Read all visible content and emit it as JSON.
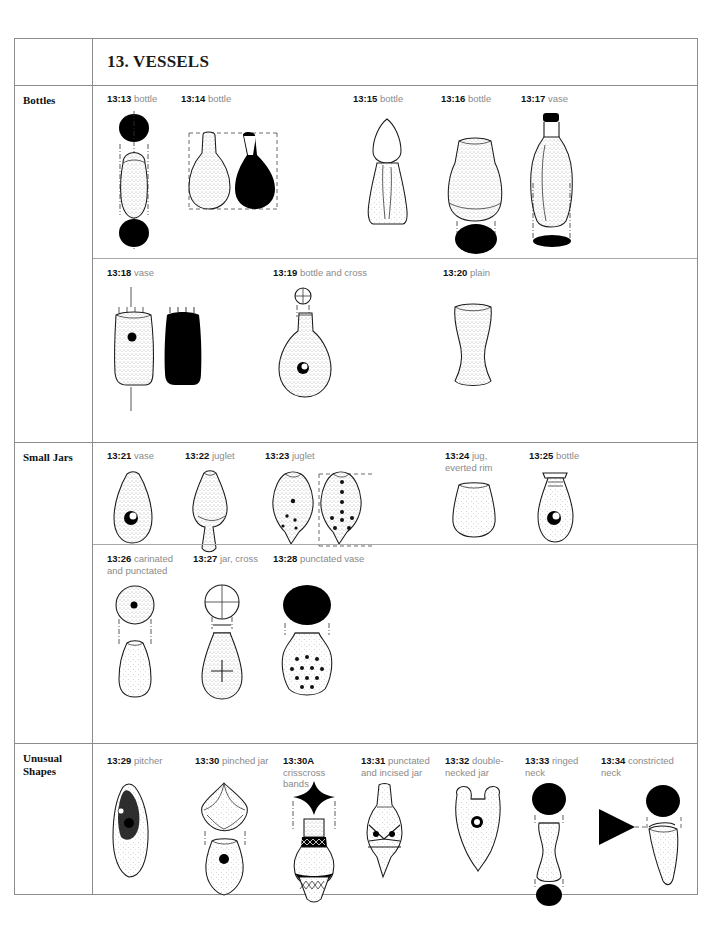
{
  "page": {
    "title": "13. VESSELS"
  },
  "sections": [
    {
      "id": "bottles",
      "category": "Bottles",
      "rows": [
        {
          "items": [
            {
              "num": "13:13",
              "desc": "bottle",
              "figure": "bottle-13-13"
            },
            {
              "num": "13:14",
              "desc": "bottle",
              "figure": "bottle-13-14"
            },
            {
              "num": "13:15",
              "desc": "bottle",
              "figure": "bottle-13-15"
            },
            {
              "num": "13:16",
              "desc": "bottle",
              "figure": "bottle-13-16"
            },
            {
              "num": "13:17",
              "desc": "vase",
              "figure": "vase-13-17"
            }
          ]
        },
        {
          "items": [
            {
              "num": "13:18",
              "desc": "vase",
              "figure": "vase-13-18"
            },
            {
              "num": "13:19",
              "desc": "bottle and cross",
              "figure": "bottle-cross-13-19"
            },
            {
              "num": "13:20",
              "desc": "plain",
              "figure": "plain-13-20"
            }
          ]
        }
      ]
    },
    {
      "id": "small-jars",
      "category": "Small Jars",
      "rows": [
        {
          "items": [
            {
              "num": "13:21",
              "desc": "vase",
              "figure": "vase-13-21"
            },
            {
              "num": "13:22",
              "desc": "juglet",
              "figure": "juglet-13-22"
            },
            {
              "num": "13:23",
              "desc": "juglet",
              "figure": "juglet-13-23"
            },
            {
              "num": "13:24",
              "desc": "jug, everted rim",
              "figure": "jug-13-24"
            },
            {
              "num": "13:25",
              "desc": "bottle",
              "figure": "bottle-13-25"
            }
          ]
        },
        {
          "items": [
            {
              "num": "13:26",
              "desc": "carinated and punctated",
              "figure": "carinated-13-26"
            },
            {
              "num": "13:27",
              "desc": "jar, cross",
              "figure": "jar-cross-13-27"
            },
            {
              "num": "13:28",
              "desc": "punctated vase",
              "figure": "punctated-vase-13-28"
            }
          ]
        }
      ]
    },
    {
      "id": "unusual-shapes",
      "category": "Unusual Shapes",
      "rows": [
        {
          "items": [
            {
              "num": "13:29",
              "desc": "pitcher",
              "figure": "pitcher-13-29"
            },
            {
              "num": "13:30",
              "desc": "pinched jar",
              "figure": "pinched-jar-13-30"
            },
            {
              "num": "13:30A",
              "desc": "crisscross bands",
              "figure": "crisscross-13-30a"
            },
            {
              "num": "13:31",
              "desc": "punctated and incised jar",
              "figure": "punctated-jar-13-31"
            },
            {
              "num": "13:32",
              "desc": "double-necked jar",
              "figure": "double-necked-13-32"
            },
            {
              "num": "13:33",
              "desc": "ringed neck",
              "figure": "ringed-neck-13-33"
            },
            {
              "num": "13:34",
              "desc": "constricted neck",
              "figure": "constricted-neck-13-34"
            }
          ]
        }
      ]
    }
  ],
  "colors": {
    "border": "#8c8c8c",
    "label_desc": "#8a8a8a",
    "label_num": "#111111",
    "ink": "#1a1a1a",
    "fill_solid": "#000000",
    "page_bg": "#ffffff"
  }
}
